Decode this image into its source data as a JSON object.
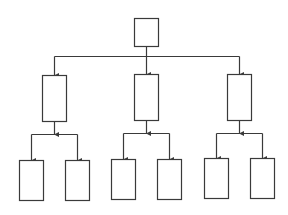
{
  "diagram": {
    "type": "hierarchy-tree",
    "colors": {
      "stroke": "#3a3a3a",
      "fill": "#ffffff",
      "background": "#ffffff"
    },
    "nodes": [
      {
        "id": "root",
        "level": 0,
        "label": "",
        "x": 134,
        "y": 18,
        "w": 24,
        "h": 28
      },
      {
        "id": "child-1",
        "level": 1,
        "label": "",
        "x": 42,
        "y": 75,
        "w": 24,
        "h": 46
      },
      {
        "id": "child-2",
        "level": 1,
        "label": "",
        "x": 134,
        "y": 74,
        "w": 24,
        "h": 46
      },
      {
        "id": "child-3",
        "level": 1,
        "label": "",
        "x": 227,
        "y": 74,
        "w": 24,
        "h": 46
      },
      {
        "id": "leaf-1a",
        "level": 2,
        "label": "",
        "x": 19,
        "y": 160,
        "w": 24,
        "h": 40
      },
      {
        "id": "leaf-1b",
        "level": 2,
        "label": "",
        "x": 65,
        "y": 160,
        "w": 24,
        "h": 40
      },
      {
        "id": "leaf-2a",
        "level": 2,
        "label": "",
        "x": 111,
        "y": 159,
        "w": 24,
        "h": 40
      },
      {
        "id": "leaf-2b",
        "level": 2,
        "label": "",
        "x": 157,
        "y": 159,
        "w": 24,
        "h": 40
      },
      {
        "id": "leaf-3a",
        "level": 2,
        "label": "",
        "x": 204,
        "y": 158,
        "w": 24,
        "h": 40
      },
      {
        "id": "leaf-3b",
        "level": 2,
        "label": "",
        "x": 250,
        "y": 158,
        "w": 24,
        "h": 40
      }
    ],
    "edges": [
      {
        "from": "root",
        "to": "child-1"
      },
      {
        "from": "root",
        "to": "child-2"
      },
      {
        "from": "root",
        "to": "child-3"
      },
      {
        "from": "child-1",
        "to": "leaf-1a"
      },
      {
        "from": "child-1",
        "to": "leaf-1b"
      },
      {
        "from": "child-2",
        "to": "leaf-2a"
      },
      {
        "from": "child-2",
        "to": "leaf-2b"
      },
      {
        "from": "child-3",
        "to": "leaf-3a"
      },
      {
        "from": "child-3",
        "to": "leaf-3b"
      }
    ]
  }
}
